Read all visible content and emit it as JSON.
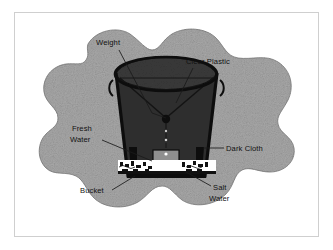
{
  "figure": {
    "frame_border_color": "#cfcfcf",
    "background_color": "#ffffff",
    "ground_color": "#a8a8a8",
    "ground_outline_color": "#7d7d7d",
    "bucket_color": "#111111",
    "bucket_interior_color": "#2e2e2e",
    "plastic_color": "#3a3a3a",
    "water_color": "#ffffff",
    "label_text_color": "#111111",
    "leader_line_color": "#1a1a1a"
  },
  "labels": [
    {
      "id": "weight",
      "text": "Weight",
      "x": 96,
      "y": 45,
      "anchor": "start"
    },
    {
      "id": "clear-plastic",
      "text": "Clear Plastic",
      "x": 186,
      "y": 64,
      "anchor": "start"
    },
    {
      "id": "fresh-water-line1",
      "text": "Fresh",
      "x": 72,
      "y": 131,
      "anchor": "start"
    },
    {
      "id": "fresh-water-line2",
      "text": "Water",
      "x": 70,
      "y": 142,
      "anchor": "start"
    },
    {
      "id": "dark-cloth",
      "text": "Dark Cloth",
      "x": 226,
      "y": 151,
      "anchor": "start"
    },
    {
      "id": "bucket",
      "text": "Bucket",
      "x": 80,
      "y": 193,
      "anchor": "start"
    },
    {
      "id": "salt-water-line1",
      "text": "Salt",
      "x": 213,
      "y": 190,
      "anchor": "start"
    },
    {
      "id": "salt-water-line2",
      "text": "Water",
      "x": 209,
      "y": 201,
      "anchor": "start"
    }
  ],
  "parts": {
    "weight_label": "Weight",
    "clear_plastic_label": "Clear Plastic",
    "fresh_water_label": "Fresh Water",
    "dark_cloth_label": "Dark Cloth",
    "bucket_label": "Bucket",
    "salt_water_label": "Salt Water"
  }
}
